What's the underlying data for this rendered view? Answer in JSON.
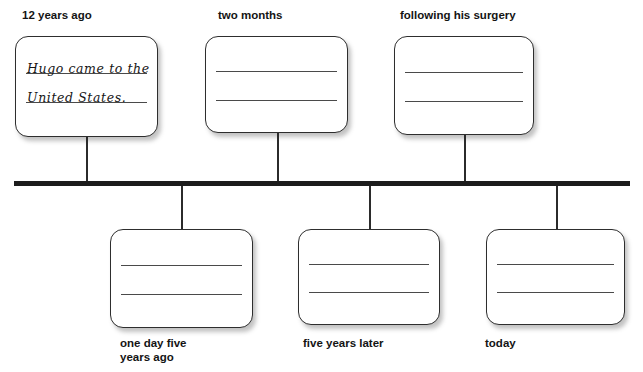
{
  "worksheet": {
    "type": "timeline-graphic-organizer",
    "bar_color": "#1c1c1c",
    "card_border_color": "#2e2e2e",
    "text_color": "#141414"
  },
  "timeline": {
    "above_entries": [
      {
        "caption": "12 years ago",
        "filled": true,
        "handwritten_line_1": "Hugo came to the",
        "handwritten_line_2": "United States."
      },
      {
        "caption": "two months",
        "filled": false,
        "handwritten_line_1": "",
        "handwritten_line_2": ""
      },
      {
        "caption": "following his surgery",
        "filled": false,
        "handwritten_line_1": "",
        "handwritten_line_2": ""
      }
    ],
    "below_entries": [
      {
        "caption": "one day five\nyears ago",
        "filled": false,
        "handwritten_line_1": "",
        "handwritten_line_2": ""
      },
      {
        "caption": "five years later",
        "filled": false,
        "handwritten_line_1": "",
        "handwritten_line_2": ""
      },
      {
        "caption": "today",
        "filled": false,
        "handwritten_line_1": "",
        "handwritten_line_2": ""
      }
    ]
  }
}
